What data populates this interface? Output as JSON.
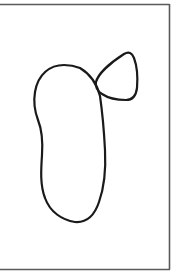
{
  "drawing": {
    "background": "#ffffff",
    "frame_color": "#555555",
    "stroke_color": "#1a1a1a",
    "shapes": [
      {
        "name": "large-blob",
        "description": "tall rounded elongated closed outline"
      },
      {
        "name": "small-blob",
        "description": "small rounded triangular closed outline attached upper right"
      }
    ]
  }
}
